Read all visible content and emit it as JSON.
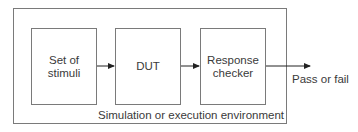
{
  "diagram": {
    "environment_label": "Simulation or execution environment",
    "blocks": [
      {
        "id": "stimuli",
        "label": "Set of stimuli",
        "lines": [
          "Set of",
          "stimuli"
        ]
      },
      {
        "id": "dut",
        "label": "DUT",
        "lines": [
          "DUT"
        ]
      },
      {
        "id": "checker",
        "label": "Response checker",
        "lines": [
          "Response",
          "checker"
        ]
      }
    ],
    "output_label": "Pass or fail",
    "edges": [
      {
        "from": "stimuli",
        "to": "dut"
      },
      {
        "from": "dut",
        "to": "checker"
      },
      {
        "from": "checker",
        "to": "output"
      }
    ],
    "colors": {
      "stroke": "#7a7a7a",
      "arrow": "#222222",
      "text": "#3a3a3a"
    }
  }
}
